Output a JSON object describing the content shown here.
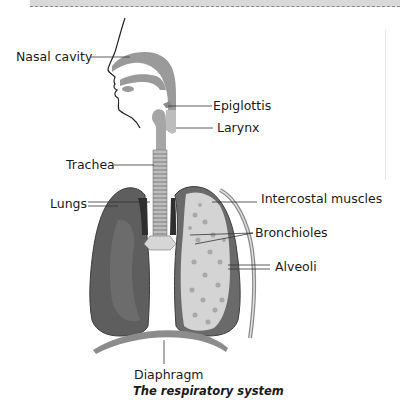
{
  "figure": {
    "caption": "The respiratory system",
    "labels": {
      "nasal_cavity": "Nasal cavity",
      "epiglottis": "Epiglottis",
      "larynx": "Larynx",
      "trachea": "Trachea",
      "lungs": "Lungs",
      "intercostal_muscles": "Intercostal muscles",
      "bronchioles": "Bronchioles",
      "alveoli": "Alveoli",
      "diaphragm": "Diaphragm"
    },
    "colors": {
      "airway_fill": "#9a9a9a",
      "left_lung": "#5e5e5e",
      "right_lung_outer": "#6a6a6a",
      "right_lung_inner": "#d8d8d8",
      "diaphragm": "#8c8c8c",
      "leader_line": "#333333"
    }
  }
}
